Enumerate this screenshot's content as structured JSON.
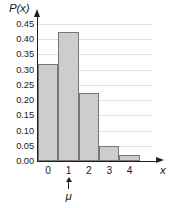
{
  "chart_data": {
    "type": "bar",
    "title": "",
    "subtitle": "",
    "xlabel": "x",
    "ylabel": "P(x)",
    "categories": [
      "0",
      "1",
      "2",
      "3",
      "4"
    ],
    "values": [
      0.32,
      0.425,
      0.222,
      0.05,
      0.02
    ],
    "ylim": [
      0.0,
      0.45
    ],
    "xlim": [
      -0.5,
      4.5
    ],
    "ytick_labels": [
      "0.00",
      "0.05",
      "0.10",
      "0.15",
      "0.20",
      "0.25",
      "0.30",
      "0.35",
      "0.40",
      "0.45"
    ],
    "ytick_values": [
      0.0,
      0.05,
      0.1,
      0.15,
      0.2,
      0.25,
      0.3,
      0.35,
      0.4,
      0.45
    ],
    "grid": true,
    "legend": false,
    "bar_fill_color": "#cdcdcd",
    "bar_border_color": "#767676",
    "axis_color": "#1f1f1f",
    "grid_color": "#e2e2e2",
    "annotations": [
      {
        "label": "μ",
        "at_category": "1",
        "marker": "up-arrow",
        "position": "below-axis"
      }
    ]
  }
}
